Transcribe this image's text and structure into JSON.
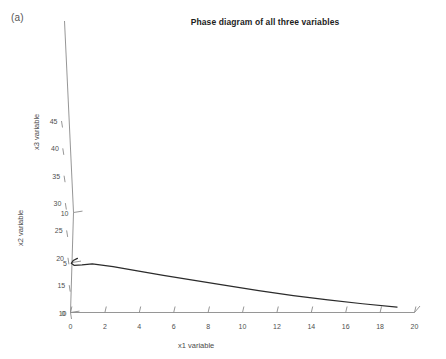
{
  "figure": {
    "panel_label": "(a)",
    "title": "Phase diagram of all three variables"
  },
  "chart_data": {
    "type": "line",
    "title": "Phase diagram of all three variables",
    "subtitle": "",
    "projection": "3d",
    "xlabel": "x1 variable",
    "ylabel": "x2 variable",
    "zlabel": "x3 variable",
    "xlim": [
      0,
      20
    ],
    "ylim": [
      0,
      10
    ],
    "zlim": [
      10,
      45
    ],
    "xticks": [
      0,
      2,
      4,
      6,
      8,
      10,
      12,
      14,
      16,
      18,
      20
    ],
    "yticks": [
      0,
      5,
      10
    ],
    "zticks": [
      10,
      15,
      20,
      25,
      30,
      35,
      40,
      45
    ],
    "xticklabels": [
      "0",
      "2",
      "4",
      "6",
      "8",
      "10",
      "12",
      "14",
      "16",
      "18",
      "20"
    ],
    "yticklabels": [
      "0",
      "5",
      "10"
    ],
    "zticklabels": [
      "10",
      "15",
      "20",
      "25",
      "30",
      "35",
      "40",
      "45"
    ],
    "grid": false,
    "legend": false,
    "legend_position": "none",
    "series": [
      {
        "name": "trajectory",
        "color": "#2b2b2b",
        "linewidth": 1.25,
        "points": [
          {
            "x1": 0.55,
            "x2": 0.0,
            "x3": 19.9
          },
          {
            "x1": 0.3,
            "x2": 0.0,
            "x3": 19.5
          },
          {
            "x1": 0.18,
            "x2": 0.0,
            "x3": 19.0
          },
          {
            "x1": 0.35,
            "x2": 0.0,
            "x3": 18.6
          },
          {
            "x1": 0.8,
            "x2": 0.0,
            "x3": 18.7
          },
          {
            "x1": 1.4,
            "x2": 0.0,
            "x3": 18.9
          },
          {
            "x1": 2.6,
            "x2": 0.0,
            "x3": 18.4
          },
          {
            "x1": 4.0,
            "x2": 0.0,
            "x3": 17.6
          },
          {
            "x1": 5.5,
            "x2": 0.0,
            "x3": 16.8
          },
          {
            "x1": 7.2,
            "x2": 0.0,
            "x3": 15.9
          },
          {
            "x1": 9.0,
            "x2": 0.0,
            "x3": 15.0
          },
          {
            "x1": 11.0,
            "x2": 0.0,
            "x3": 14.0
          },
          {
            "x1": 13.0,
            "x2": 0.0,
            "x3": 13.1
          },
          {
            "x1": 15.0,
            "x2": 0.0,
            "x3": 12.3
          },
          {
            "x1": 17.0,
            "x2": 0.0,
            "x3": 11.6
          },
          {
            "x1": 19.0,
            "x2": 0.0,
            "x3": 11.0
          }
        ]
      }
    ]
  },
  "axes": {
    "x1": {
      "label": "x1 variable",
      "ticks": [
        "0",
        "2",
        "4",
        "6",
        "8",
        "10",
        "12",
        "14",
        "16",
        "18",
        "20"
      ]
    },
    "x2": {
      "label": "x2 variable",
      "ticks": [
        "0",
        "5",
        "10"
      ]
    },
    "x3": {
      "label": "x3 variable",
      "ticks": [
        "45",
        "40",
        "35",
        "30",
        "25",
        "20",
        "15",
        "10"
      ]
    }
  },
  "colors": {
    "axis": "#8a8a8a",
    "trajectory": "#2b2b2b",
    "text": "#4f4f4f",
    "title": "#1d1d1d",
    "background": "#ffffff"
  }
}
